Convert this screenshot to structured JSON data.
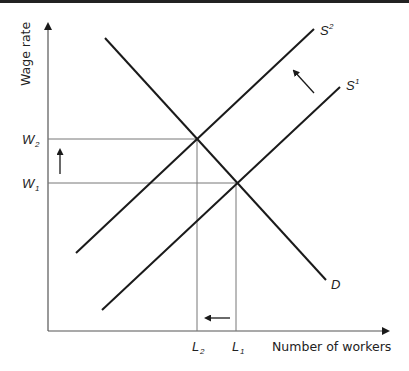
{
  "diagram": {
    "title": "",
    "y_axis_label": "Wage rate",
    "x_axis_label": "Number of workers",
    "curves": {
      "demand": "D",
      "supply_1": "S",
      "supply_1_sup": "1",
      "supply_2": "S",
      "supply_2_sup": "2"
    },
    "y_ticks": {
      "w2": "W",
      "w2_sub": "2",
      "w1": "W",
      "w1_sub": "1"
    },
    "x_ticks": {
      "l2": "L",
      "l2_sub": "2",
      "l1": "L",
      "l1_sub": "1"
    },
    "annotations": [
      "Arrow showing supply shift left/up from S1 to S2",
      "Arrow showing wage rise from W1 to W2",
      "Arrow showing employment fall from L1 to L2"
    ],
    "colors": {
      "line": "#1a1a1a",
      "guide": "#777777",
      "text": "#222222"
    }
  }
}
